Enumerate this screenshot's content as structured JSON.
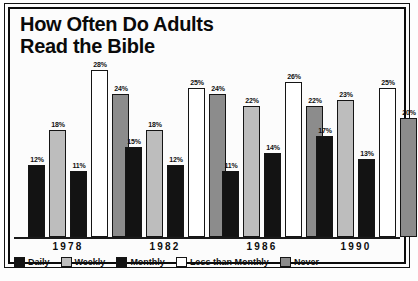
{
  "chart_data": {
    "type": "bar",
    "title": "How Often Do Adults Read the Bible",
    "title_line1": "How Often Do Adults",
    "title_line2": "Read the Bible",
    "xlabel": "",
    "ylabel": "",
    "ylim": [
      0,
      30
    ],
    "grid": false,
    "legend_position": "bottom",
    "value_labels_suffix": "%",
    "categories": [
      "1978",
      "1982",
      "1986",
      "1990"
    ],
    "series": [
      {
        "name": "Daily",
        "color": "#131313",
        "values": [
          12,
          15,
          11,
          17
        ]
      },
      {
        "name": "Weekly",
        "color": "#bdbdbd",
        "values": [
          18,
          18,
          22,
          23
        ]
      },
      {
        "name": "Monthly",
        "color": "#131313",
        "values": [
          11,
          12,
          14,
          13
        ]
      },
      {
        "name": "Less than Monthly",
        "color": "#ffffff",
        "values": [
          28,
          25,
          26,
          25
        ]
      },
      {
        "name": "Never",
        "color": "#8c8c8c",
        "values": [
          24,
          24,
          22,
          20
        ]
      }
    ],
    "point_labels": {
      "1978": [
        "12%",
        "18%",
        "11%",
        "28%",
        "24%"
      ],
      "1982": [
        "15%",
        "18%",
        "12%",
        "25%",
        "24%"
      ],
      "1986": [
        "11%",
        "22%",
        "14%",
        "26%",
        "22%"
      ],
      "1990": [
        "17%",
        "23%",
        "13%",
        "25%",
        "20%"
      ]
    }
  },
  "legend": {
    "items": [
      {
        "label": "Daily"
      },
      {
        "label": "Weekly"
      },
      {
        "label": "Monthly"
      },
      {
        "label": "Less than Monthly"
      },
      {
        "label": "Never"
      }
    ]
  },
  "axis": {
    "years": [
      "1978",
      "1982",
      "1986",
      "1990"
    ]
  }
}
